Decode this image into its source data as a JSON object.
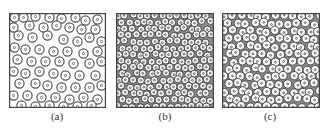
{
  "figure": {
    "panels": [
      {
        "id": "a",
        "label": "(a)",
        "x": 9,
        "width": 96,
        "height": 94,
        "ring_radius": 4.6,
        "stroke": "#555555",
        "fill": "#ffffff",
        "circles": [
          [
            5,
            4
          ],
          [
            14,
            4
          ],
          [
            26,
            3
          ],
          [
            40,
            4
          ],
          [
            52,
            5
          ],
          [
            66,
            4
          ],
          [
            76,
            7
          ],
          [
            88,
            6
          ],
          [
            4,
            14
          ],
          [
            20,
            12
          ],
          [
            34,
            14
          ],
          [
            47,
            12
          ],
          [
            60,
            14
          ],
          [
            72,
            16
          ],
          [
            86,
            16
          ],
          [
            9,
            22
          ],
          [
            23,
            24
          ],
          [
            38,
            22
          ],
          [
            54,
            26
          ],
          [
            68,
            28
          ],
          [
            80,
            24
          ],
          [
            92,
            28
          ],
          [
            5,
            34
          ],
          [
            16,
            36
          ],
          [
            30,
            36
          ],
          [
            44,
            38
          ],
          [
            58,
            38
          ],
          [
            74,
            40
          ],
          [
            88,
            38
          ],
          [
            8,
            46
          ],
          [
            22,
            48
          ],
          [
            36,
            48
          ],
          [
            50,
            48
          ],
          [
            64,
            50
          ],
          [
            80,
            50
          ],
          [
            92,
            48
          ],
          [
            4,
            58
          ],
          [
            16,
            60
          ],
          [
            30,
            58
          ],
          [
            44,
            60
          ],
          [
            56,
            62
          ],
          [
            70,
            62
          ],
          [
            86,
            62
          ],
          [
            10,
            70
          ],
          [
            26,
            70
          ],
          [
            38,
            72
          ],
          [
            52,
            74
          ],
          [
            66,
            74
          ],
          [
            80,
            74
          ],
          [
            92,
            72
          ],
          [
            4,
            82
          ],
          [
            18,
            82
          ],
          [
            32,
            84
          ],
          [
            46,
            84
          ],
          [
            60,
            86
          ],
          [
            74,
            84
          ],
          [
            88,
            86
          ],
          [
            12,
            92
          ],
          [
            26,
            93
          ],
          [
            40,
            92
          ],
          [
            54,
            93
          ],
          [
            68,
            93
          ],
          [
            82,
            92
          ]
        ]
      },
      {
        "id": "b",
        "label": "(b)",
        "x": 116,
        "width": 97,
        "height": 94,
        "ring_radius": 3.6,
        "stroke": "#4a4a4a",
        "fill": "#f4f4f4",
        "circles": []
      },
      {
        "id": "c",
        "label": "(c)",
        "x": 222,
        "width": 97,
        "height": 94,
        "ring_radius": 4.2,
        "stroke": "#4a4a4a",
        "fill": "#f7f7f7",
        "circles": []
      }
    ]
  }
}
